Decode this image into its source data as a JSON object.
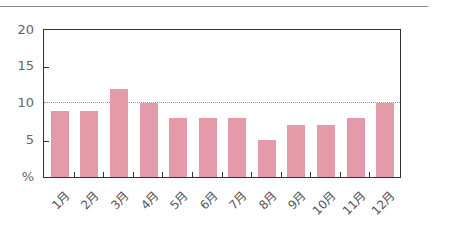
{
  "chart_data": {
    "type": "bar",
    "title": "",
    "xlabel": "",
    "ylabel": "%",
    "categories": [
      "1月",
      "2月",
      "3月",
      "4月",
      "5月",
      "6月",
      "7月",
      "8月",
      "9月",
      "10月",
      "11月",
      "12月"
    ],
    "values": [
      9,
      9,
      12,
      10,
      8,
      8,
      8,
      5,
      7,
      7,
      8,
      10
    ],
    "ylim": [
      0,
      20
    ],
    "yticks": [
      "%",
      "5",
      "10",
      "15",
      "20"
    ],
    "reference_line": 10,
    "grid": false,
    "bar_color": "#e59aaa"
  }
}
